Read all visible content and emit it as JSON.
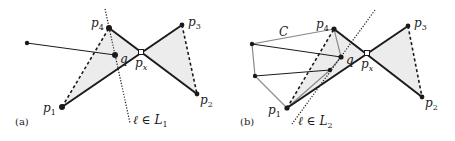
{
  "panels": [
    {
      "caption": "(a)",
      "labels": {
        "p1": "p",
        "p1_sub": "1",
        "p2": "p",
        "p2_sub": "2",
        "p3": "p",
        "p3_sub": "3",
        "p4": "p",
        "p4_sub": "4",
        "px": "p",
        "px_sub": "x",
        "q": "q",
        "line": "ℓ ∈ L",
        "line_sub": "1"
      }
    },
    {
      "caption": "(b)",
      "labels": {
        "p1": "p",
        "p1_sub": "1",
        "p2": "p",
        "p2_sub": "2",
        "p3": "p",
        "p3_sub": "3",
        "p4": "p",
        "p4_sub": "4",
        "px": "p",
        "px_sub": "x",
        "q": "q",
        "C": "C",
        "line": "ℓ ∈ L",
        "line_sub": "2"
      }
    }
  ],
  "colors": {
    "ink": "#1a1a1a",
    "gray_edge": "#8a8a8a",
    "shade": "#ececec"
  }
}
